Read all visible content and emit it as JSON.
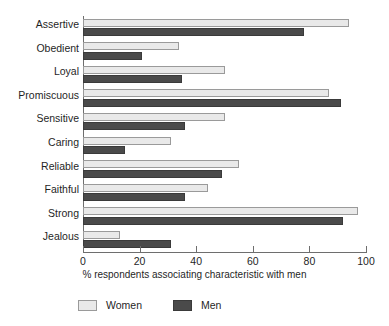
{
  "chart_data": {
    "type": "bar",
    "orientation": "horizontal",
    "title": "",
    "xlabel": "% respondents associating characteristic with men",
    "ylabel": "",
    "xlim": [
      0,
      100
    ],
    "xticks": [
      0,
      20,
      40,
      60,
      80,
      100
    ],
    "grid": false,
    "legend_position": "bottom-left",
    "categories": [
      "Assertive",
      "Obedient",
      "Loyal",
      "Promiscuous",
      "Sensitive",
      "Caring",
      "Reliable",
      "Faithful",
      "Strong",
      "Jealous"
    ],
    "series": [
      {
        "name": "Women",
        "color": "#e9e9e9",
        "values": [
          94,
          34,
          50,
          87,
          50,
          31,
          55,
          44,
          97,
          13
        ]
      },
      {
        "name": "Men",
        "color": "#4a4a4a",
        "values": [
          78,
          21,
          35,
          91,
          36,
          15,
          49,
          36,
          92,
          31
        ]
      }
    ]
  },
  "axis": {
    "x_title": "% respondents associating characteristic with men",
    "tick_labels": [
      "0",
      "20",
      "40",
      "60",
      "80",
      "100"
    ]
  },
  "legend": {
    "items": [
      {
        "label": "Women",
        "swatch": "women-swatch"
      },
      {
        "label": "Men",
        "swatch": "men-swatch"
      }
    ]
  }
}
